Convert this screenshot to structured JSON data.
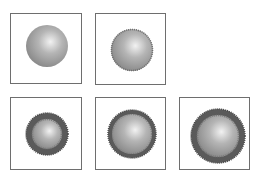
{
  "figure": {
    "background": "#ffffff",
    "frame_color": "#6e6e6e",
    "panels": [
      {
        "id": "p1",
        "row": 1,
        "col": 1,
        "x": 10,
        "y": 13,
        "w": 72,
        "h": 71,
        "cx": 36,
        "cy": 32,
        "r": 21,
        "edge": "smooth",
        "shell_width": 0
      },
      {
        "id": "p2",
        "row": 1,
        "col": 2,
        "x": 95,
        "y": 13,
        "w": 71,
        "h": 72,
        "cx": 36,
        "cy": 36,
        "r": 21,
        "edge": "serrated",
        "shell_width": 0
      },
      {
        "id": "p3",
        "row": 2,
        "col": 1,
        "x": 10,
        "y": 97,
        "w": 72,
        "h": 73,
        "cx": 36,
        "cy": 36,
        "r": 21,
        "edge": "serrated",
        "shell_width": 6
      },
      {
        "id": "p4",
        "row": 2,
        "col": 2,
        "x": 95,
        "y": 97,
        "w": 71,
        "h": 73,
        "cx": 36,
        "cy": 36,
        "r": 24,
        "edge": "dotted",
        "shell_width": 4
      },
      {
        "id": "p5",
        "row": 2,
        "col": 3,
        "x": 179,
        "y": 97,
        "w": 71,
        "h": 73,
        "cx": 38,
        "cy": 38,
        "r": 27,
        "edge": "serrated",
        "shell_width": 6
      }
    ],
    "colors": {
      "sphere_highlight": "#f2f2f2",
      "sphere_mid": "#b5b5b5",
      "sphere_edge": "#8a8a8a",
      "shell": "#5a5a5a",
      "shell_edge": "#474747"
    }
  }
}
